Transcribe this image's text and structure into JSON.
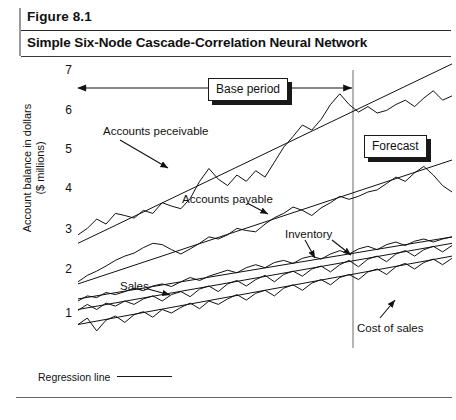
{
  "figure": {
    "number": "Figure 8.1",
    "title": "Simple Six-Node Cascade-Correlation Neural Network"
  },
  "axis": {
    "y_title": "Account balance in dollars\n($ millions)",
    "y_ticks": [
      "7",
      "6",
      "5",
      "4",
      "3",
      "2",
      "1"
    ]
  },
  "callouts": {
    "base_period": "Base period",
    "forecast": "Forecast"
  },
  "annotations": {
    "accounts_receivable": "Accounts peceivable",
    "accounts_payable": "Accounts payable",
    "inventory": "Inventory",
    "sales": "Sales",
    "cost_of_sales": "Cost of sales"
  },
  "legend": {
    "regression_line": "Regression line"
  },
  "colors": {
    "ink": "#111111",
    "rule": "#2a2a2a",
    "paper": "#ffffff"
  },
  "chart_data": {
    "type": "line",
    "title": "Simple Six-Node Cascade-Correlation Neural Network",
    "xlabel": "",
    "ylabel": "Account balance in dollars ($ millions)",
    "ylim": [
      0.4,
      7.0
    ],
    "yticks": [
      1,
      2,
      3,
      4,
      5,
      6,
      7
    ],
    "grid": false,
    "legend": "Regression line",
    "forecast_divider_x_frac": 0.76,
    "base_period_span_frac": [
      0.0,
      0.76
    ],
    "x": [
      0,
      0.025,
      0.05,
      0.075,
      0.1,
      0.125,
      0.15,
      0.175,
      0.2,
      0.225,
      0.25,
      0.275,
      0.3,
      0.325,
      0.35,
      0.375,
      0.4,
      0.425,
      0.45,
      0.475,
      0.5,
      0.525,
      0.55,
      0.575,
      0.6,
      0.625,
      0.65,
      0.675,
      0.7,
      0.725,
      0.75,
      0.775,
      0.8,
      0.825,
      0.85,
      0.875,
      0.9,
      0.925,
      0.95,
      0.975,
      1.0
    ],
    "series": [
      {
        "name": "Accounts peceivable",
        "regression_endpoints": [
          2.85,
          7.05
        ],
        "values": [
          3.05,
          3.2,
          3.42,
          3.3,
          3.55,
          3.5,
          3.44,
          3.62,
          3.55,
          3.8,
          3.72,
          3.66,
          3.9,
          4.3,
          4.6,
          4.35,
          4.2,
          4.45,
          4.3,
          4.55,
          4.4,
          4.75,
          5.1,
          5.35,
          5.62,
          5.5,
          5.75,
          6.1,
          6.35,
          6.1,
          5.92,
          6.05,
          5.9,
          5.96,
          6.1,
          6.2,
          6.05,
          6.25,
          6.42,
          6.2,
          6.3
        ]
      },
      {
        "name": "Accounts payable",
        "regression_endpoints": [
          1.9,
          4.8
        ],
        "values": [
          1.95,
          2.1,
          2.2,
          2.32,
          2.45,
          2.55,
          2.62,
          2.75,
          2.85,
          2.82,
          2.7,
          2.6,
          2.72,
          2.85,
          3.0,
          2.95,
          3.05,
          3.2,
          3.15,
          3.12,
          3.3,
          3.45,
          3.55,
          3.7,
          3.62,
          3.5,
          3.68,
          3.8,
          3.95,
          3.88,
          3.95,
          4.05,
          4.1,
          4.25,
          4.4,
          4.3,
          4.5,
          4.65,
          4.45,
          4.2,
          4.05
        ]
      },
      {
        "name": "Inventory",
        "regression_endpoints": [
          1.55,
          3.0
        ],
        "values": [
          1.5,
          1.62,
          1.58,
          1.7,
          1.65,
          1.72,
          1.8,
          1.74,
          1.85,
          1.9,
          1.84,
          1.95,
          2.05,
          1.98,
          2.08,
          2.15,
          2.22,
          2.16,
          2.28,
          2.35,
          2.28,
          2.4,
          2.45,
          2.38,
          2.5,
          2.55,
          2.48,
          2.6,
          2.68,
          2.6,
          2.72,
          2.78,
          2.7,
          2.82,
          2.88,
          2.8,
          2.9,
          2.95,
          2.88,
          2.95,
          3.0
        ]
      },
      {
        "name": "Sales",
        "regression_endpoints": [
          1.3,
          2.85
        ],
        "values": [
          1.28,
          1.42,
          1.3,
          1.45,
          1.38,
          1.5,
          1.42,
          1.55,
          1.62,
          1.5,
          1.65,
          1.72,
          1.6,
          1.78,
          1.85,
          1.72,
          1.9,
          1.98,
          1.85,
          2.0,
          2.1,
          1.95,
          2.12,
          2.2,
          2.08,
          2.25,
          2.32,
          2.18,
          2.35,
          2.45,
          2.3,
          2.48,
          2.55,
          2.42,
          2.6,
          2.68,
          2.55,
          2.7,
          2.78,
          2.65,
          2.8
        ]
      },
      {
        "name": "Cost of sales",
        "regression_endpoints": [
          0.95,
          2.55
        ],
        "values": [
          0.95,
          1.1,
          0.8,
          1.05,
          1.15,
          1.0,
          1.18,
          1.25,
          1.12,
          1.3,
          1.22,
          1.35,
          1.45,
          1.32,
          1.5,
          1.42,
          1.55,
          1.65,
          1.52,
          1.68,
          1.75,
          1.62,
          1.8,
          1.88,
          1.75,
          1.92,
          2.0,
          1.88,
          2.05,
          2.12,
          2.0,
          2.18,
          2.25,
          2.12,
          2.3,
          2.38,
          2.25,
          2.4,
          2.48,
          2.35,
          2.5
        ]
      }
    ]
  }
}
